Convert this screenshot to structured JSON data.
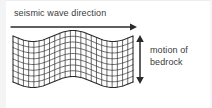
{
  "figure": {
    "background_color": "#ffffff",
    "stroke_color": "#2b2b2b",
    "text_color": "#3b3b3b",
    "width": 212,
    "height": 108
  },
  "labels": {
    "wave_direction": "seismic wave direction",
    "bedrock_motion_line1": "motion of",
    "bedrock_motion_line2": "bedrock"
  },
  "arrows": {
    "horizontal": {
      "name": "seismic-wave-direction-arrow",
      "orientation": "horizontal",
      "heads": "single-right",
      "x1": 11,
      "x2": 137,
      "y": 27
    },
    "vertical": {
      "name": "bedrock-motion-arrow",
      "orientation": "vertical",
      "heads": "double",
      "x": 140,
      "y1": 35,
      "y2": 84
    }
  },
  "mesh": {
    "name": "bedrock-wave-mesh",
    "left": 13,
    "right": 133,
    "top": 36,
    "bottom": 82,
    "columns": 23,
    "rows": 8,
    "wave_amplitude": 5.5,
    "wave_cycles": 1.5,
    "wave_phase_deg": 0,
    "stroke_width": 0.7
  }
}
